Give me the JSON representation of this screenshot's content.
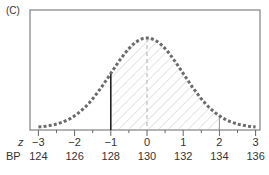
{
  "panel_label": "(C)",
  "chart_data": {
    "type": "area",
    "title": "",
    "curve": "normal",
    "mean": 130,
    "sd": 2,
    "x_axes": [
      {
        "name": "z",
        "ticks": [
          "−3",
          "−2",
          "−1",
          "0",
          "1",
          "2",
          "3"
        ],
        "values": [
          -3,
          -2,
          -1,
          0,
          1,
          2,
          3
        ]
      },
      {
        "name": "BP",
        "ticks": [
          "124",
          "126",
          "128",
          "130",
          "132",
          "134",
          "136"
        ],
        "values": [
          124,
          126,
          128,
          130,
          132,
          134,
          136
        ]
      }
    ],
    "shaded_region": {
      "z_from": -1,
      "z_to": 2,
      "bp_from": 128,
      "bp_to": 134,
      "pattern": "diagonal-hatch"
    },
    "reference_lines": [
      {
        "z": -1,
        "style": "solid-dark"
      },
      {
        "z": 0,
        "style": "dashed"
      },
      {
        "z": 2,
        "style": "solid-thin"
      }
    ],
    "xlim": [
      -3,
      3
    ],
    "grid": false,
    "legend": null
  },
  "axes": {
    "z_label": "z",
    "bp_label": "BP",
    "z_ticks": [
      "−3",
      "−2",
      "−1",
      "0",
      "1",
      "2",
      "3"
    ],
    "bp_ticks": [
      "124",
      "126",
      "128",
      "130",
      "132",
      "134",
      "136"
    ]
  },
  "colors": {
    "curve": "#6b6b6b",
    "frame": "#8a8a8a",
    "hatch": "#c8c8c8",
    "text": "#333333"
  }
}
